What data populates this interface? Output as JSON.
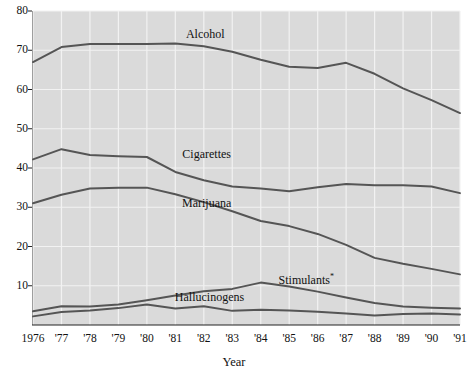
{
  "chart_data": {
    "type": "line",
    "title": "",
    "xlabel": "Year",
    "ylabel": "",
    "x": [
      1976,
      1977,
      1978,
      1979,
      1980,
      1981,
      1982,
      1983,
      1984,
      1985,
      1986,
      1987,
      1988,
      1989,
      1990,
      1991
    ],
    "xticklabels": [
      "1976",
      "'77",
      "'78",
      "'79",
      "'80",
      "'81",
      "'82",
      "'83",
      "'84",
      "'85",
      "'86",
      "'87",
      "'88",
      "'89",
      "'90",
      "'91"
    ],
    "yticklabels": [
      "10",
      "20",
      "30",
      "40",
      "50",
      "60",
      "70",
      "80"
    ],
    "yticks": [
      10,
      20,
      30,
      40,
      50,
      60,
      70,
      80
    ],
    "ylim": [
      0,
      80
    ],
    "xlim": [
      1976,
      1991
    ],
    "grid": true,
    "legend_position": "inline-labels",
    "series": [
      {
        "name": "Alcohol",
        "label": "Alcohol",
        "label_x": 1982.05,
        "label_y": 74.2,
        "values": [
          67.0,
          70.8,
          71.6,
          71.6,
          71.6,
          71.7,
          71.0,
          69.6,
          67.6,
          65.8,
          65.5,
          66.8,
          64.0,
          60.3,
          57.3,
          54.0
        ]
      },
      {
        "name": "Cigarettes",
        "label": "Cigarettes",
        "label_x": 1982.1,
        "label_y": 43.5,
        "values": [
          42.2,
          44.8,
          43.3,
          43.0,
          42.8,
          39.0,
          36.9,
          35.3,
          34.8,
          34.1,
          35.1,
          35.9,
          35.6,
          35.6,
          35.3,
          33.6
        ]
      },
      {
        "name": "Marijuana",
        "label": "Marijuana",
        "label_x": 1982.1,
        "label_y": 31.0,
        "values": [
          31.0,
          33.2,
          34.8,
          35.0,
          35.0,
          33.3,
          31.3,
          29.0,
          26.5,
          25.2,
          23.2,
          20.4,
          17.1,
          15.6,
          14.3,
          12.9
        ]
      },
      {
        "name": "Stimulants*",
        "label": "Stimulants",
        "label_sup": "*",
        "label_x": 1985.6,
        "label_y": 12.2,
        "values": [
          3.5,
          4.8,
          4.7,
          5.2,
          6.3,
          7.5,
          8.6,
          9.2,
          10.8,
          9.8,
          8.5,
          7.0,
          5.6,
          4.7,
          4.4,
          4.2
        ]
      },
      {
        "name": "Hallucinogens",
        "label": "Hallucinogens",
        "label_x": 1982.2,
        "label_y": 7.1,
        "values": [
          2.2,
          3.3,
          3.7,
          4.3,
          5.2,
          4.2,
          4.8,
          3.6,
          3.9,
          3.7,
          3.4,
          2.9,
          2.4,
          2.8,
          2.9,
          2.7
        ]
      }
    ],
    "colors": {
      "plot_background": "#dadada",
      "grid_line": "#f2f2f2",
      "line_color": "#555555",
      "axis_color": "#222222",
      "text_color": "#111111",
      "page_background": "#ffffff"
    }
  }
}
